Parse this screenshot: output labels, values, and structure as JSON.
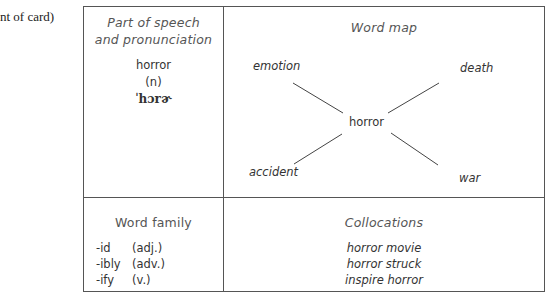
{
  "caption": "nt of card)",
  "card": {
    "part_of_speech": {
      "heading_line1": "Part of speech",
      "heading_line2": "and pronunciation",
      "word": "horror",
      "pos": "(n)",
      "ipa": "ˈhɔrɚ"
    },
    "word_map": {
      "heading": "Word map",
      "center": "horror",
      "nodes": {
        "top_left": "emotion",
        "top_right": "death",
        "bottom_left": "accident",
        "bottom_right": "war"
      }
    },
    "word_family": {
      "heading": "Word family",
      "items": [
        {
          "suffix": "-id",
          "pos": "(adj.)"
        },
        {
          "suffix": "-ibly",
          "pos": "(adv.)"
        },
        {
          "suffix": "-ify",
          "pos": "(v.)"
        }
      ]
    },
    "collocations": {
      "heading": "Collocations",
      "items": [
        "horror movie",
        "horror struck",
        "inspire horror"
      ]
    }
  }
}
